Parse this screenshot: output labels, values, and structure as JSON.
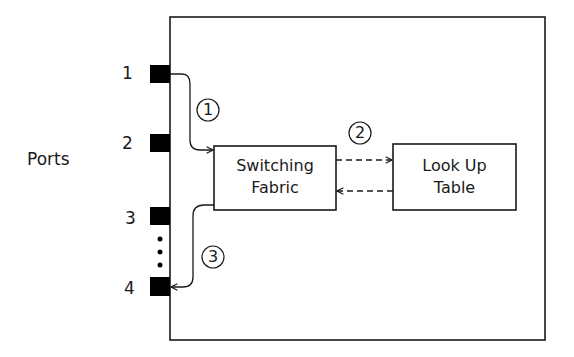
{
  "diagram": {
    "side_label": "Ports",
    "ports": [
      {
        "label": "1"
      },
      {
        "label": "2"
      },
      {
        "label": "3"
      },
      {
        "label": "4"
      }
    ],
    "ellipsis": "⋮",
    "boxes": {
      "switching_fabric": {
        "line1": "Switching",
        "line2": "Fabric"
      },
      "lookup_table": {
        "line1": "Look Up",
        "line2": "Table"
      }
    },
    "steps": [
      {
        "label": "1",
        "glyph": "①",
        "description": "Port 1 to Switching Fabric"
      },
      {
        "label": "2",
        "glyph": "②",
        "description": "Switching Fabric ⇄ Look Up Table"
      },
      {
        "label": "3",
        "glyph": "③",
        "description": "Switching Fabric to Port 4"
      }
    ],
    "colors": {
      "line": "#1a1a1a",
      "port_fill": "#000000",
      "background": "#ffffff"
    }
  }
}
